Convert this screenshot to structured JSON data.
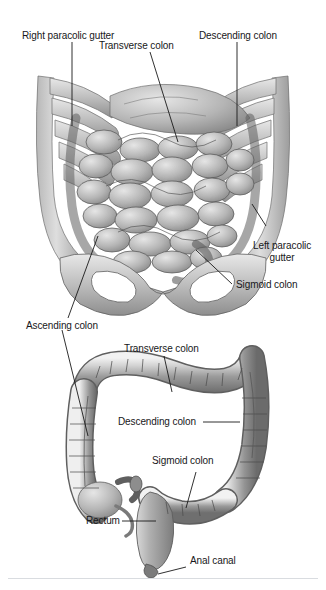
{
  "figure": {
    "background_color": "#ffffff",
    "text_color": "#17181a",
    "leader_color": "#1a1a1a",
    "panels": [
      {
        "id": "panel-upper",
        "name": "abdomen-in-situ",
        "description": "Anterior view of opened abdomen showing rib cage, small intestine coils, colon frame and pelvis"
      },
      {
        "id": "panel-lower",
        "name": "isolated-large-intestine",
        "description": "Isolated large intestine showing cecum, appendix, ascending, transverse, descending, sigmoid colon, rectum and anal canal"
      }
    ],
    "labels": [
      {
        "id": "right-paracolic-gutter",
        "text": "Right paracolic gutter",
        "panel": "panel-upper",
        "lines": 1
      },
      {
        "id": "transverse-colon-upper",
        "text": "Transverse colon",
        "panel": "panel-upper",
        "lines": 1
      },
      {
        "id": "descending-colon-upper",
        "text": "Descending colon",
        "panel": "panel-upper",
        "lines": 1
      },
      {
        "id": "left-paracolic-gutter",
        "text": "Left paracolic gutter",
        "panel": "panel-upper",
        "lines": 2
      },
      {
        "id": "sigmoid-colon-upper",
        "text": "Sigmoid colon",
        "panel": "panel-upper",
        "lines": 1
      },
      {
        "id": "ascending-colon",
        "text": "Ascending colon",
        "panel": "panel-lower",
        "lines": 1
      },
      {
        "id": "transverse-colon-lower",
        "text": "Transverse colon",
        "panel": "panel-lower",
        "lines": 1
      },
      {
        "id": "descending-colon-lower",
        "text": "Descending colon",
        "panel": "panel-lower",
        "lines": 1
      },
      {
        "id": "sigmoid-colon-lower",
        "text": "Sigmoid colon",
        "panel": "panel-lower",
        "lines": 1
      },
      {
        "id": "rectum",
        "text": "Rectum",
        "panel": "panel-lower",
        "lines": 1
      },
      {
        "id": "anal-canal",
        "text": "Anal canal",
        "panel": "panel-lower",
        "lines": 1
      }
    ]
  }
}
